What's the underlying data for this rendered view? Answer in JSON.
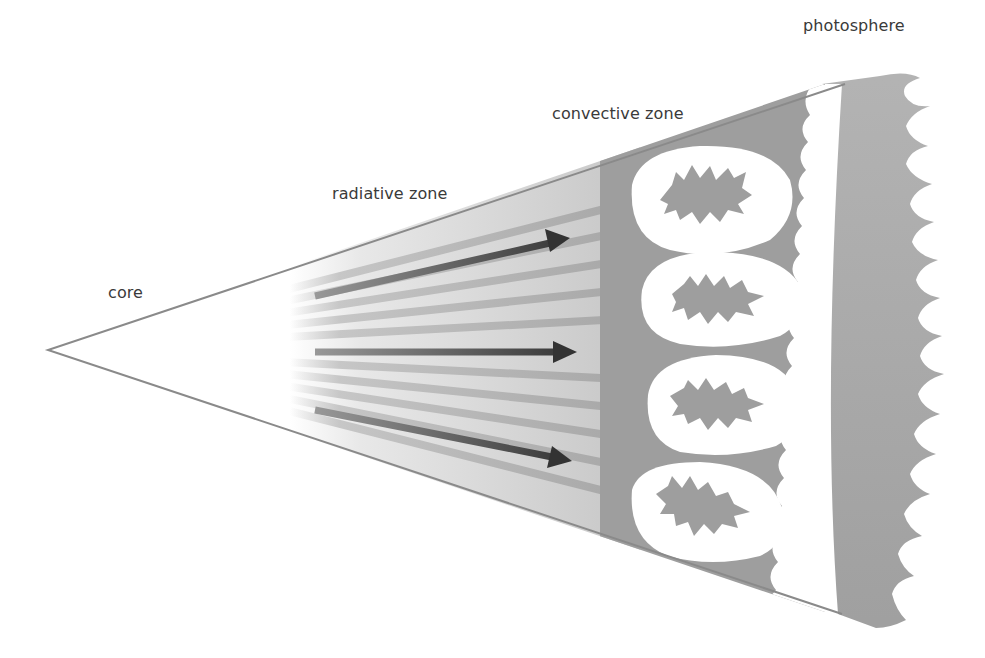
{
  "diagram": {
    "labels": {
      "core": "core",
      "radiative_zone": "radiative zone",
      "convective_zone": "convective zone",
      "photosphere": "photosphere"
    },
    "radiative_arrows": 3,
    "convection_cells": 4,
    "colors": {
      "background": "#ffffff",
      "outline": "#8a8a8a",
      "convective_fill": "#9e9e9e",
      "arrow": "#3c3c3c",
      "stripe": "#bdbdbd",
      "label_text": "#3a3a3a"
    }
  }
}
